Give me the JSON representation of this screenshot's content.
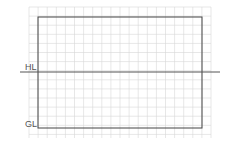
{
  "diagram": {
    "type": "perspective-drawing-grid",
    "labels": {
      "horizon_line": "HL",
      "ground_line": "GL"
    },
    "colors": {
      "background": "#ffffff",
      "grid": "#d6d6d6",
      "frame": "#444444",
      "horizon": "#555555",
      "label": "#555555"
    },
    "grid": {
      "x_start": 29,
      "x_end": 211,
      "y_start": 7,
      "y_end": 138,
      "cell": 9.1
    },
    "frame": {
      "x": 38,
      "y": 17,
      "width": 164,
      "height": 111
    },
    "horizon_line": {
      "y": 72,
      "x1": 20,
      "x2": 220
    }
  }
}
